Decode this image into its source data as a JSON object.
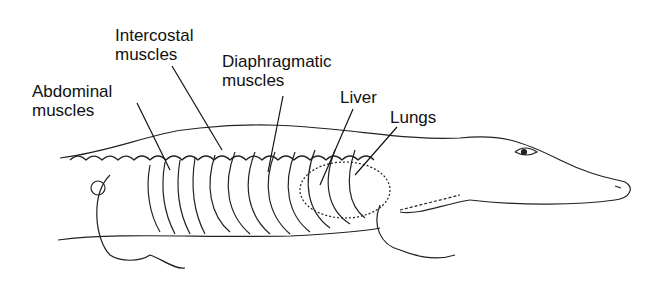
{
  "figure": {
    "labels": [
      {
        "id": "intercostal",
        "text": "Intercostal\nmuscles",
        "x": 115,
        "y": 26,
        "line": [
          172,
          66,
          222,
          150
        ]
      },
      {
        "id": "diaphragmatic",
        "text": "Diaphragmatic\nmuscles",
        "x": 222,
        "y": 52,
        "line": [
          283,
          96,
          268,
          172
        ]
      },
      {
        "id": "abdominal",
        "text": "Abdominal\nmuscles",
        "x": 32,
        "y": 82,
        "line": [
          137,
          103,
          170,
          170
        ]
      },
      {
        "id": "liver",
        "text": "Liver",
        "x": 340,
        "y": 88,
        "line": [
          353,
          109,
          320,
          185
        ]
      },
      {
        "id": "lungs",
        "text": "Lungs",
        "x": 390,
        "y": 108,
        "line": [
          397,
          127,
          355,
          175
        ]
      }
    ],
    "colors": {
      "ink": "#111111",
      "background": "#ffffff"
    }
  }
}
